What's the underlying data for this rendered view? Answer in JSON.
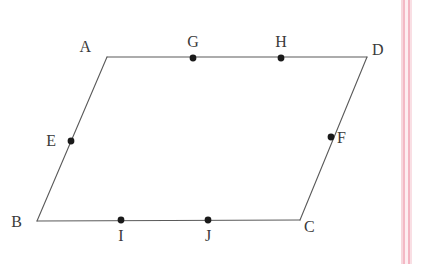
{
  "figure": {
    "shape_type": "parallelogram",
    "background_color": "#ffffff",
    "line_color": "#5a5a5a",
    "dot_color": "#1a1a1a",
    "label_color": "#3a3a3a",
    "vertices": [
      {
        "id": "A",
        "label": "A",
        "x": 107,
        "y": 57,
        "label_x": 91,
        "label_y": 52,
        "anchor": "end"
      },
      {
        "id": "B",
        "label": "B",
        "x": 37,
        "y": 221,
        "label_x": 22,
        "label_y": 227,
        "anchor": "end"
      },
      {
        "id": "C",
        "label": "C",
        "x": 300,
        "y": 220,
        "label_x": 304,
        "label_y": 232,
        "anchor": "start"
      },
      {
        "id": "D",
        "label": "D",
        "x": 367,
        "y": 57,
        "label_x": 372,
        "label_y": 55,
        "anchor": "start"
      }
    ],
    "marked_points": [
      {
        "id": "E",
        "label": "E",
        "x": 71,
        "y": 141,
        "on_edge": "A-B",
        "label_x": 56,
        "label_y": 146,
        "anchor": "end"
      },
      {
        "id": "F",
        "label": "F",
        "x": 331,
        "y": 137,
        "on_edge": "D-C",
        "label_x": 337,
        "label_y": 143,
        "anchor": "start"
      },
      {
        "id": "G",
        "label": "G",
        "x": 193,
        "y": 58,
        "on_edge": "A-D",
        "label_x": 193,
        "label_y": 47,
        "anchor": "middle"
      },
      {
        "id": "H",
        "label": "H",
        "x": 281,
        "y": 58,
        "on_edge": "A-D",
        "label_x": 281,
        "label_y": 47,
        "anchor": "middle"
      },
      {
        "id": "I",
        "label": "I",
        "x": 121,
        "y": 220,
        "on_edge": "B-C",
        "label_x": 121,
        "label_y": 241,
        "anchor": "middle"
      },
      {
        "id": "J",
        "label": "J",
        "x": 208,
        "y": 220,
        "on_edge": "B-C",
        "label_x": 208,
        "label_y": 241,
        "anchor": "middle"
      }
    ],
    "edges": [
      {
        "id": "A-D",
        "from": "A",
        "to": "D"
      },
      {
        "id": "D-C",
        "from": "D",
        "to": "C"
      },
      {
        "id": "C-B",
        "from": "C",
        "to": "B"
      },
      {
        "id": "B-A",
        "from": "B",
        "to": "A"
      }
    ],
    "dot_radius": 3.2,
    "stroke_width": 1.1
  },
  "scan_artifacts": {
    "stripes": [
      {
        "id": "stripe-outer-left",
        "x": 401,
        "width": 2,
        "color": "#f7d7dd"
      },
      {
        "id": "stripe-inner-left",
        "x": 403,
        "width": 2,
        "color": "#f4b9c5"
      },
      {
        "id": "stripe-gap",
        "x": 405,
        "width": 3,
        "color": "#fdeef1"
      },
      {
        "id": "stripe-inner-right",
        "x": 408,
        "width": 2,
        "color": "#f3b5c2"
      },
      {
        "id": "stripe-outer-right",
        "x": 410,
        "width": 2,
        "color": "#f9dfe4"
      }
    ]
  }
}
